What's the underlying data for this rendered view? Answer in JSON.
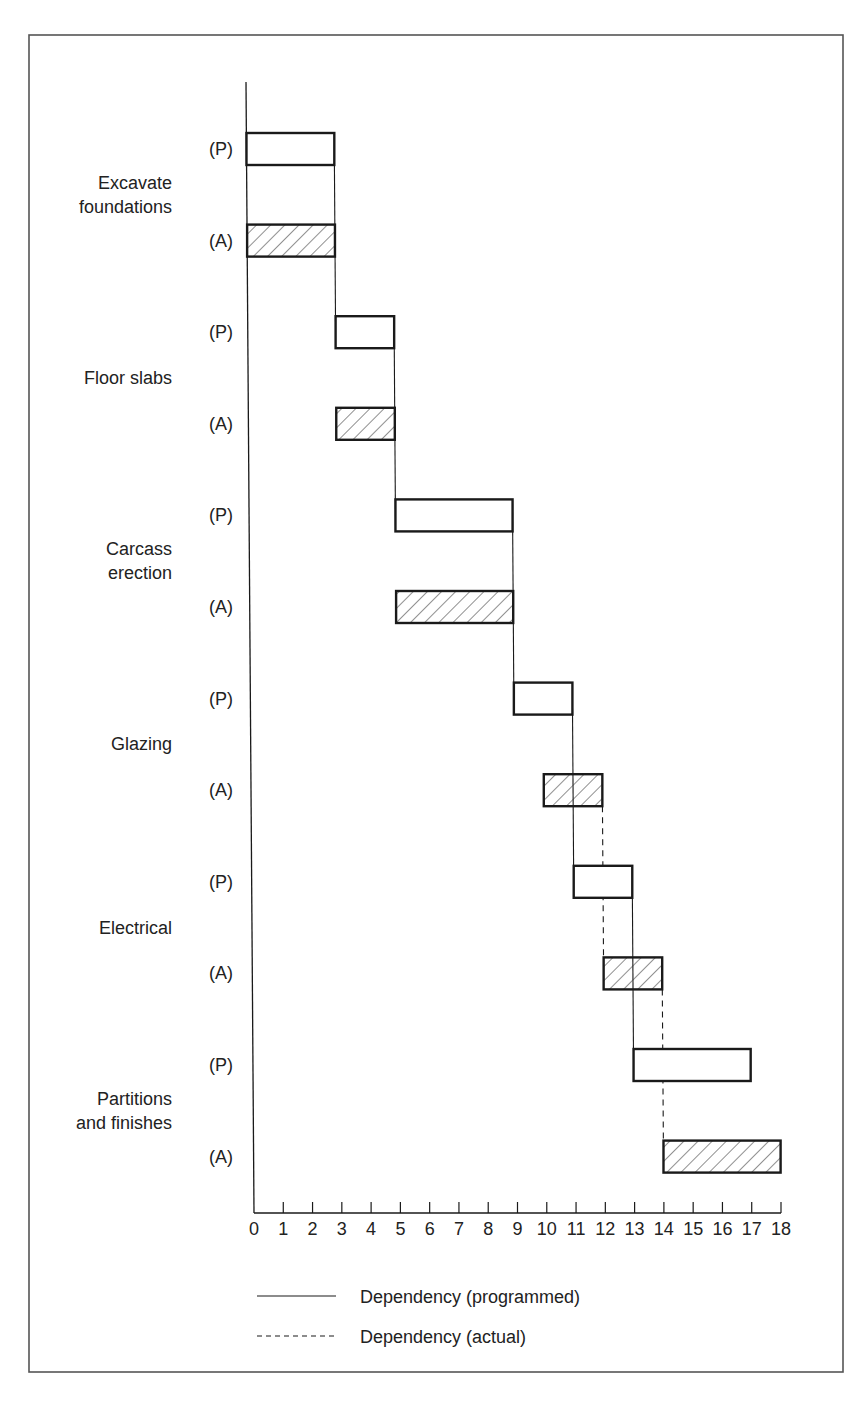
{
  "chart_data": {
    "type": "gantt",
    "title": "",
    "xlabel": "",
    "ylabel": "",
    "xlim": [
      0,
      18
    ],
    "x_ticks": [
      0,
      1,
      2,
      3,
      4,
      5,
      6,
      7,
      8,
      9,
      10,
      11,
      12,
      13,
      14,
      15,
      16,
      17,
      18
    ],
    "grid": false,
    "row_labels": {
      "programmed": "(P)",
      "actual": "(A)"
    },
    "tasks": [
      {
        "name": "Excavate foundations",
        "lines": [
          "Excavate",
          "foundations"
        ],
        "programmed": [
          0,
          3
        ],
        "actual": [
          0,
          3
        ]
      },
      {
        "name": "Floor slabs",
        "lines": [
          "Floor slabs"
        ],
        "programmed": [
          3,
          5
        ],
        "actual": [
          3,
          5
        ]
      },
      {
        "name": "Carcass erection",
        "lines": [
          "Carcass",
          "erection"
        ],
        "programmed": [
          5,
          9
        ],
        "actual": [
          5,
          9
        ]
      },
      {
        "name": "Glazing",
        "lines": [
          "Glazing"
        ],
        "programmed": [
          9,
          11
        ],
        "actual": [
          10,
          12
        ]
      },
      {
        "name": "Electrical",
        "lines": [
          "Electrical"
        ],
        "programmed": [
          11,
          13
        ],
        "actual": [
          12,
          14
        ]
      },
      {
        "name": "Partitions and finishes",
        "lines": [
          "Partitions",
          "and finishes"
        ],
        "programmed": [
          13,
          17
        ],
        "actual": [
          14,
          18
        ]
      }
    ],
    "dependencies_programmed": [
      {
        "x": 3,
        "from_task": 0,
        "to_task": 1
      },
      {
        "x": 5,
        "from_task": 1,
        "to_task": 2
      },
      {
        "x": 9,
        "from_task": 2,
        "to_task": 3
      },
      {
        "x": 11,
        "from_task": 3,
        "to_task": 4
      },
      {
        "x": 13,
        "from_task": 4,
        "to_task": 5
      }
    ],
    "dependencies_actual": [
      {
        "x": 12,
        "from_task": 3,
        "to_task": 4
      },
      {
        "x": 14,
        "from_task": 4,
        "to_task": 5
      }
    ],
    "legend": [
      {
        "style": "solid",
        "label": "Dependency (programmed)"
      },
      {
        "style": "dashed",
        "label": "Dependency (actual)"
      }
    ],
    "legend_position": "bottom",
    "bar_styles": {
      "programmed": "open",
      "actual": "hatched"
    }
  },
  "colors": {
    "ink": "#1a1a1a",
    "frame": "#555555",
    "background": "#ffffff"
  }
}
